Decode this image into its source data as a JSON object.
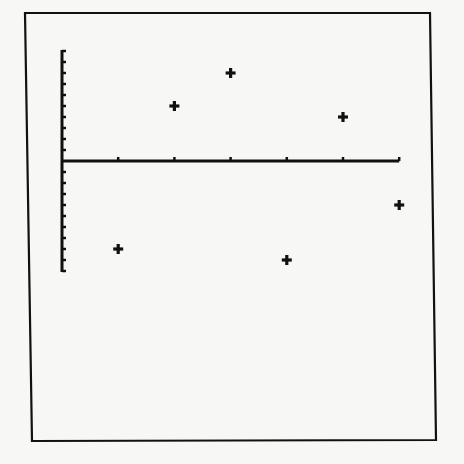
{
  "chart_data": {
    "type": "scatter",
    "title": "",
    "xlabel": "",
    "ylabel": "",
    "x_ticks": [
      1,
      2,
      3,
      4,
      5,
      6
    ],
    "y_ticks_count_above": 10,
    "y_ticks_count_below": 10,
    "xlim": [
      0,
      6
    ],
    "ylim": [
      -10,
      10
    ],
    "grid": false,
    "legend": null,
    "tick_labels_shown": false,
    "marker": "plus",
    "series": [
      {
        "name": "points",
        "x": [
          1,
          2,
          3,
          4,
          5,
          6
        ],
        "y": [
          -8,
          5,
          8,
          -9,
          4,
          -4
        ]
      }
    ]
  },
  "colors": {
    "background": "#f7f7f5",
    "ink": "#111111"
  }
}
